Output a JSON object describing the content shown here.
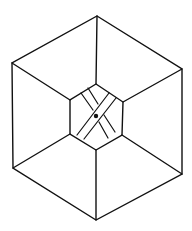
{
  "figure": {
    "colors": {
      "background": "#ffffff",
      "stroke": "#111111"
    },
    "outer_hexagon": [
      [
        97,
        16
      ],
      [
        182,
        69
      ],
      [
        182,
        174
      ],
      [
        96,
        220
      ],
      [
        13,
        168
      ],
      [
        12,
        63
      ]
    ],
    "inner_hexagon": [
      [
        96,
        84
      ],
      [
        123,
        102
      ],
      [
        122,
        135
      ],
      [
        96,
        150
      ],
      [
        70,
        134
      ],
      [
        70,
        100
      ]
    ],
    "center_dot": {
      "cx": 96,
      "cy": 116,
      "r": 2.2
    },
    "front_band": [
      [
        [
          77,
          135
        ],
        [
          109,
          93
        ]
      ],
      [
        [
          84,
          139
        ],
        [
          116,
          98
        ]
      ]
    ],
    "back_band": [
      [
        [
          81,
          93
        ],
        [
          93,
          110
        ]
      ],
      [
        [
          99,
          122
        ],
        [
          108,
          138
        ]
      ],
      [
        [
          88,
          88
        ],
        [
          98,
          104
        ]
      ],
      [
        [
          104,
          115
        ],
        [
          115,
          132
        ]
      ]
    ]
  }
}
